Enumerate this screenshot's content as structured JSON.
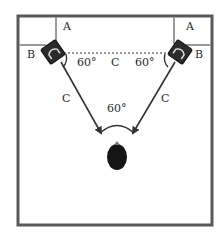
{
  "diagram": {
    "labels": {
      "left_wall_distance": "A",
      "left_side_distance": "B",
      "right_wall_distance": "A",
      "right_side_distance": "B",
      "speaker_spacing": "C",
      "left_to_listener": "C",
      "right_to_listener": "C",
      "left_speaker_angle": "60°",
      "right_speaker_angle": "60°",
      "listener_angle": "60°"
    },
    "colors": {
      "frame": "#5a5a5a",
      "inner_lines": "#9a9a9a",
      "speaker": "#2b2b2b",
      "listener": "#151515",
      "arrow": "#333333",
      "dotted_line": "#9a9a9a"
    }
  }
}
